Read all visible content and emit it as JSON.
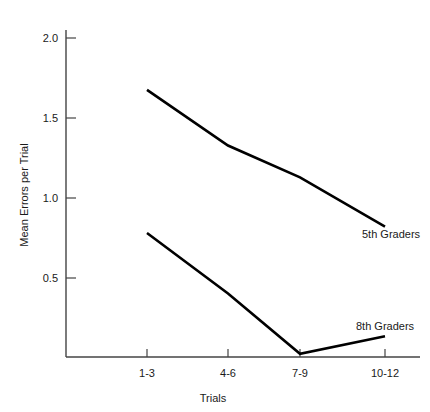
{
  "chart_data": {
    "type": "line",
    "title": "",
    "xlabel": "Trials",
    "ylabel": "Mean Errors per Trial",
    "categories": [
      "1-3",
      "4-6",
      "7-9",
      "10-12"
    ],
    "ylim": [
      0.0,
      2.0
    ],
    "yticks": [
      0.5,
      1.0,
      1.5,
      2.0
    ],
    "ytick_labels": [
      "0.5",
      "1.0",
      "1.5",
      "2.0"
    ],
    "grid": false,
    "legend_position": "inline-right",
    "series": [
      {
        "name": "5th Graders",
        "values": [
          1.68,
          1.33,
          1.13,
          0.82
        ],
        "color": "#000000"
      },
      {
        "name": "8th Graders",
        "values": [
          0.78,
          0.4,
          0.02,
          0.13
        ],
        "color": "#000000"
      }
    ],
    "annotations": [
      {
        "text": "5th Graders",
        "series": "5th Graders"
      },
      {
        "text": "8th Graders",
        "series": "8th Graders"
      }
    ]
  },
  "axes": {
    "x_tick_labels": [
      "1-3",
      "4-6",
      "7-9",
      "10-12"
    ],
    "y_tick_labels": [
      "0.5",
      "1.0",
      "1.5",
      "2.0"
    ],
    "x_axis_title": "Trials",
    "y_axis_title": "Mean Errors per Trial"
  },
  "series_labels": {
    "fifth": "5th Graders",
    "eighth": "8th Graders"
  }
}
